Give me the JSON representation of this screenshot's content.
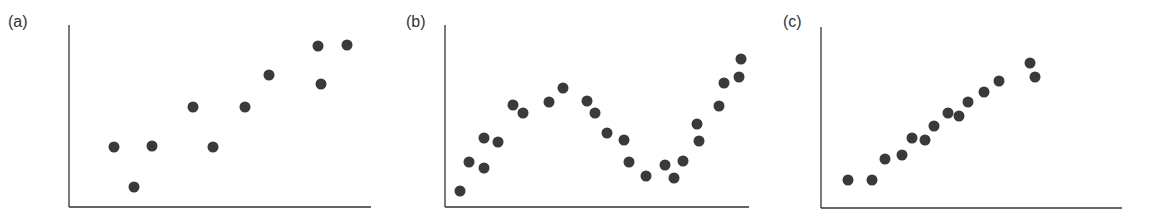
{
  "colors": {
    "dot": "#3a3a3a",
    "axis": "#333333",
    "label": "#333333",
    "background": "#ffffff"
  },
  "chart_data": [
    {
      "type": "scatter",
      "title": "(a)",
      "xlabel": "",
      "ylabel": "",
      "grid": false,
      "ticks": false,
      "axis_px": {
        "x0": 69,
        "x1": 371,
        "y_top": 25,
        "y_base": 207
      },
      "label_px": {
        "x": 8,
        "y": 14
      },
      "points": [
        {
          "x": 114,
          "y": 147
        },
        {
          "x": 134,
          "y": 187
        },
        {
          "x": 152,
          "y": 146
        },
        {
          "x": 193,
          "y": 107
        },
        {
          "x": 213,
          "y": 147
        },
        {
          "x": 245,
          "y": 107
        },
        {
          "x": 269,
          "y": 75
        },
        {
          "x": 318,
          "y": 46
        },
        {
          "x": 321,
          "y": 84
        },
        {
          "x": 347,
          "y": 45
        }
      ]
    },
    {
      "type": "scatter",
      "title": "(b)",
      "xlabel": "",
      "ylabel": "",
      "grid": false,
      "ticks": false,
      "axis_px": {
        "x0": 445,
        "x1": 749,
        "y_top": 25,
        "y_base": 207
      },
      "label_px": {
        "x": 406,
        "y": 14
      },
      "points": [
        {
          "x": 460,
          "y": 191
        },
        {
          "x": 469,
          "y": 162
        },
        {
          "x": 484,
          "y": 138
        },
        {
          "x": 484,
          "y": 168
        },
        {
          "x": 498,
          "y": 142
        },
        {
          "x": 513,
          "y": 105
        },
        {
          "x": 523,
          "y": 113
        },
        {
          "x": 549,
          "y": 102
        },
        {
          "x": 563,
          "y": 88
        },
        {
          "x": 587,
          "y": 101
        },
        {
          "x": 595,
          "y": 113
        },
        {
          "x": 607,
          "y": 133
        },
        {
          "x": 624,
          "y": 140
        },
        {
          "x": 629,
          "y": 162
        },
        {
          "x": 646,
          "y": 176
        },
        {
          "x": 665,
          "y": 165
        },
        {
          "x": 674,
          "y": 178
        },
        {
          "x": 683,
          "y": 161
        },
        {
          "x": 697,
          "y": 124
        },
        {
          "x": 699,
          "y": 141
        },
        {
          "x": 719,
          "y": 106
        },
        {
          "x": 724,
          "y": 83
        },
        {
          "x": 739,
          "y": 77
        },
        {
          "x": 741,
          "y": 59
        }
      ]
    },
    {
      "type": "scatter",
      "title": "(c)",
      "xlabel": "",
      "ylabel": "",
      "grid": false,
      "ticks": false,
      "axis_px": {
        "x0": 821,
        "x1": 1122,
        "y_top": 27,
        "y_base": 208
      },
      "label_px": {
        "x": 783,
        "y": 14
      },
      "points": [
        {
          "x": 848,
          "y": 180
        },
        {
          "x": 872,
          "y": 180
        },
        {
          "x": 885,
          "y": 159
        },
        {
          "x": 902,
          "y": 155
        },
        {
          "x": 912,
          "y": 138
        },
        {
          "x": 925,
          "y": 140
        },
        {
          "x": 934,
          "y": 126
        },
        {
          "x": 948,
          "y": 113
        },
        {
          "x": 959,
          "y": 116
        },
        {
          "x": 968,
          "y": 102
        },
        {
          "x": 984,
          "y": 92
        },
        {
          "x": 999,
          "y": 81
        },
        {
          "x": 1030,
          "y": 63
        },
        {
          "x": 1035,
          "y": 77
        }
      ]
    }
  ]
}
